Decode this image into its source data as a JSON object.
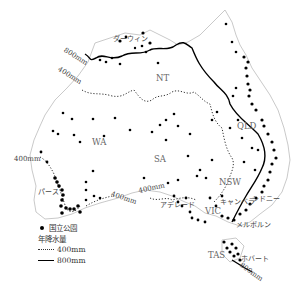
{
  "map": {
    "subject": "Australia national parks and annual rainfall",
    "regions": [
      {
        "code": "WA",
        "x": 92,
        "y": 140
      },
      {
        "code": "NT",
        "x": 158,
        "y": 75
      },
      {
        "code": "SA",
        "x": 154,
        "y": 155
      },
      {
        "code": "QLD",
        "x": 237,
        "y": 124
      },
      {
        "code": "NSW",
        "x": 219,
        "y": 178
      },
      {
        "code": "VIC",
        "x": 202,
        "y": 208
      },
      {
        "code": "TAS",
        "x": 209,
        "y": 251
      }
    ],
    "cities": [
      {
        "name": "ダーウィン",
        "x": 115,
        "y": 38
      },
      {
        "name": "パース",
        "x": 40,
        "y": 189
      },
      {
        "name": "アデレード",
        "x": 160,
        "y": 204
      },
      {
        "name": "キャンベラ",
        "x": 221,
        "y": 199
      },
      {
        "name": "シドニー",
        "x": 252,
        "y": 197
      },
      {
        "name": "メルボルン",
        "x": 234,
        "y": 222
      },
      {
        "name": "ホバート",
        "x": 241,
        "y": 257
      }
    ],
    "isohyet_labels": [
      {
        "text": "800mm",
        "x": 65,
        "y": 54,
        "rotate": 32
      },
      {
        "text": "400mm",
        "x": 58,
        "y": 73,
        "rotate": 32
      },
      {
        "text": "400mm",
        "x": 14,
        "y": 158,
        "rotate": 0
      },
      {
        "text": "400mm",
        "x": 116,
        "y": 193,
        "rotate": 18
      },
      {
        "text": "400mm",
        "x": 118,
        "y": 220,
        "rotate": 0
      },
      {
        "text": "800mm",
        "x": 242,
        "y": 265,
        "rotate": 35
      }
    ]
  },
  "legend": {
    "park_label": "国立公園",
    "rainfall_title": "年降水量",
    "line_400": "400mm",
    "line_800": "800mm"
  },
  "colors": {
    "ink": "#000000",
    "text": "#555555",
    "background": "#ffffff"
  }
}
